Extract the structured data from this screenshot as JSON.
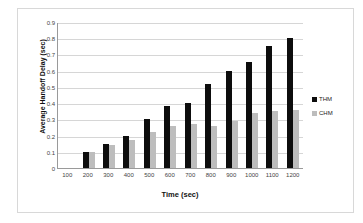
{
  "chart_data": {
    "type": "bar",
    "title": "",
    "xlabel": "Time (sec)",
    "ylabel": "Average Handoff Delay (sec)",
    "categories": [
      "100",
      "200",
      "300",
      "400",
      "500",
      "600",
      "700",
      "800",
      "900",
      "1000",
      "1100",
      "1200"
    ],
    "series": [
      {
        "name": "THM",
        "color": "#0d0d0d",
        "values": [
          0,
          0.1,
          0.15,
          0.2,
          0.3,
          0.38,
          0.4,
          0.52,
          0.6,
          0.655,
          0.75,
          0.8
        ]
      },
      {
        "name": "CHM",
        "color": "#bdbdbd",
        "values": [
          0,
          0.1,
          0.14,
          0.17,
          0.22,
          0.26,
          0.27,
          0.26,
          0.29,
          0.34,
          0.35,
          0.36
        ]
      }
    ],
    "ylim": [
      0,
      0.9
    ],
    "ytick_labels": [
      "0.9",
      "0.8",
      "0.7",
      "0.6",
      "0.5",
      "0.4",
      "0.3",
      "0.2",
      "0.1",
      "0"
    ],
    "ytick_values": [
      0.9,
      0.8,
      0.7,
      0.6,
      0.5,
      0.4,
      0.3,
      0.2,
      0.1,
      0
    ],
    "grid": true,
    "legend_position": "right",
    "legend": [
      "THM",
      "CHM"
    ]
  }
}
